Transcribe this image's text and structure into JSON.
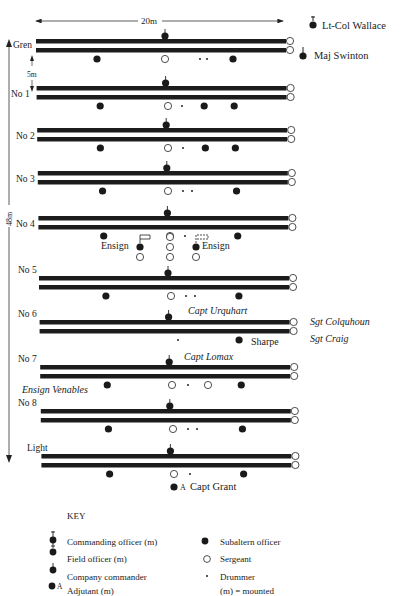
{
  "diagram": {
    "caption_fragment": "...ng the p...",
    "width_label": "20m",
    "height_label": "48m",
    "gap_label": "5m",
    "colors": {
      "ink": "#1a1a1a",
      "bar": "#1c1c1c",
      "paper": "#ffffff"
    },
    "officers_top": [
      {
        "name": "Lt-Col Wallace",
        "type": "commanding-officer"
      },
      {
        "name": "Maj Swinton",
        "type": "field-officer"
      }
    ],
    "companies": [
      {
        "label": "Gren",
        "y": 41,
        "subalterns": [
          97,
          233
        ],
        "sergeants_center": [
          165
        ],
        "drummers": [
          200,
          207
        ]
      },
      {
        "label": "No 1",
        "y": 88,
        "subalterns": [
          100,
          204,
          234
        ],
        "sergeants_center": [
          168
        ],
        "drummers": [
          182
        ]
      },
      {
        "label": "No 2",
        "y": 130,
        "subalterns": [
          100,
          205,
          235
        ],
        "sergeants_center": [
          168
        ],
        "drummers": [
          183
        ]
      },
      {
        "label": "No 3",
        "y": 173,
        "subalterns": [
          102,
          236
        ],
        "sergeants_center": [
          168
        ],
        "drummers": [
          183,
          192
        ]
      },
      {
        "label": "No 4",
        "y": 218,
        "subalterns": [
          103,
          237
        ],
        "sergeants_center": [
          170
        ],
        "drummers": [
          185
        ]
      },
      {
        "label": "No 5",
        "y": 278,
        "subalterns": [
          105,
          238
        ],
        "sergeants_center": [
          171
        ],
        "drummers": [
          186,
          195
        ]
      },
      {
        "label": "No 6",
        "y": 322,
        "subalterns": [
          238
        ],
        "sergeants_center": [],
        "drummers": [
          178
        ]
      },
      {
        "label": "No 7",
        "y": 367,
        "subalterns": [
          106,
          240
        ],
        "sergeants_center": [
          172,
          208
        ],
        "drummers": [
          188
        ]
      },
      {
        "label": "No 8",
        "y": 411,
        "subalterns": [
          107,
          241
        ],
        "sergeants_center": [
          173
        ],
        "drummers": [
          188,
          197
        ]
      },
      {
        "label": "Light",
        "y": 456,
        "subalterns": [
          108,
          242
        ],
        "sergeants_center": [
          174
        ],
        "drummers": [
          190
        ]
      }
    ],
    "annotations": {
      "ensign_left": "Ensign",
      "ensign_right": "Ensign",
      "capt_urquhart": "Capt Urquhart",
      "sgt_colquhoun": "Sgt Colquhoun",
      "sgt_craig": "Sgt Craig",
      "sharpe": "Sharpe",
      "capt_lomax": "Capt Lomax",
      "ensign_venables": "Ensign Venables",
      "adjutant_marker": "A",
      "capt_grant": "Capt Grant"
    }
  },
  "key": {
    "title": "KEY",
    "left": [
      {
        "icon": "commanding-officer",
        "label": "Commanding officer (m)"
      },
      {
        "icon": "field-officer",
        "label": "Field officer (m)"
      },
      {
        "icon": "company-commander",
        "label": "Company commander"
      },
      {
        "icon": "adjutant",
        "label": "Adjutant (m)"
      }
    ],
    "right": [
      {
        "icon": "subaltern",
        "label": "Subaltern officer"
      },
      {
        "icon": "sergeant",
        "label": "Sergeant"
      },
      {
        "icon": "drummer",
        "label": "Drummer"
      },
      {
        "icon": "none",
        "label": "(m) = mounted"
      }
    ]
  }
}
